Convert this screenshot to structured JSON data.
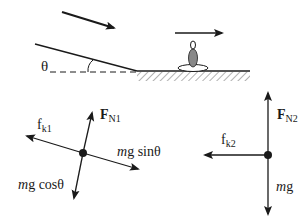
{
  "scene": {
    "incline_angle_label": "θ",
    "incline_velocity_arrow": "velocity-arrow-down-slope",
    "flat_velocity_arrow": "velocity-arrow-right",
    "object": "skier"
  },
  "fbd_incline": {
    "friction": {
      "symbol": "f",
      "subscript": "k1"
    },
    "normal": {
      "symbol": "F",
      "subscript": "N1"
    },
    "gravity_parallel": {
      "mass": "m",
      "g": "g",
      "trig": "sinθ"
    },
    "gravity_perpendicular": {
      "mass": "m",
      "g": "g",
      "trig": "cosθ"
    }
  },
  "fbd_flat": {
    "friction": {
      "symbol": "f",
      "subscript": "k2"
    },
    "normal": {
      "symbol": "F",
      "subscript": "N2"
    },
    "gravity": {
      "mass": "m",
      "g": "g"
    }
  },
  "colors": {
    "ink": "#1a1a1a",
    "hatch": "#666666",
    "skier_body": "#888888"
  }
}
